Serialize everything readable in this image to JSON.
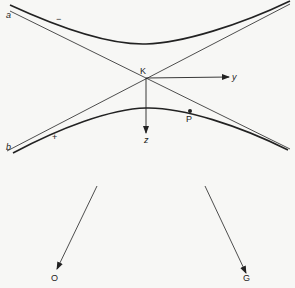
{
  "diagram": {
    "labels": {
      "a": "a",
      "b": "b",
      "minus": "−",
      "plus": "+",
      "K": "K",
      "y": "y",
      "z": "z",
      "P": "P",
      "O": "O",
      "G": "G"
    },
    "colors": {
      "ink": "#222222",
      "background": "#f7f7f5"
    },
    "points": {
      "K": [
        146,
        78
      ],
      "P": [
        190,
        111
      ],
      "O_arrow_tip": [
        56,
        270
      ],
      "G_arrow_tip": [
        246,
        274
      ]
    }
  }
}
